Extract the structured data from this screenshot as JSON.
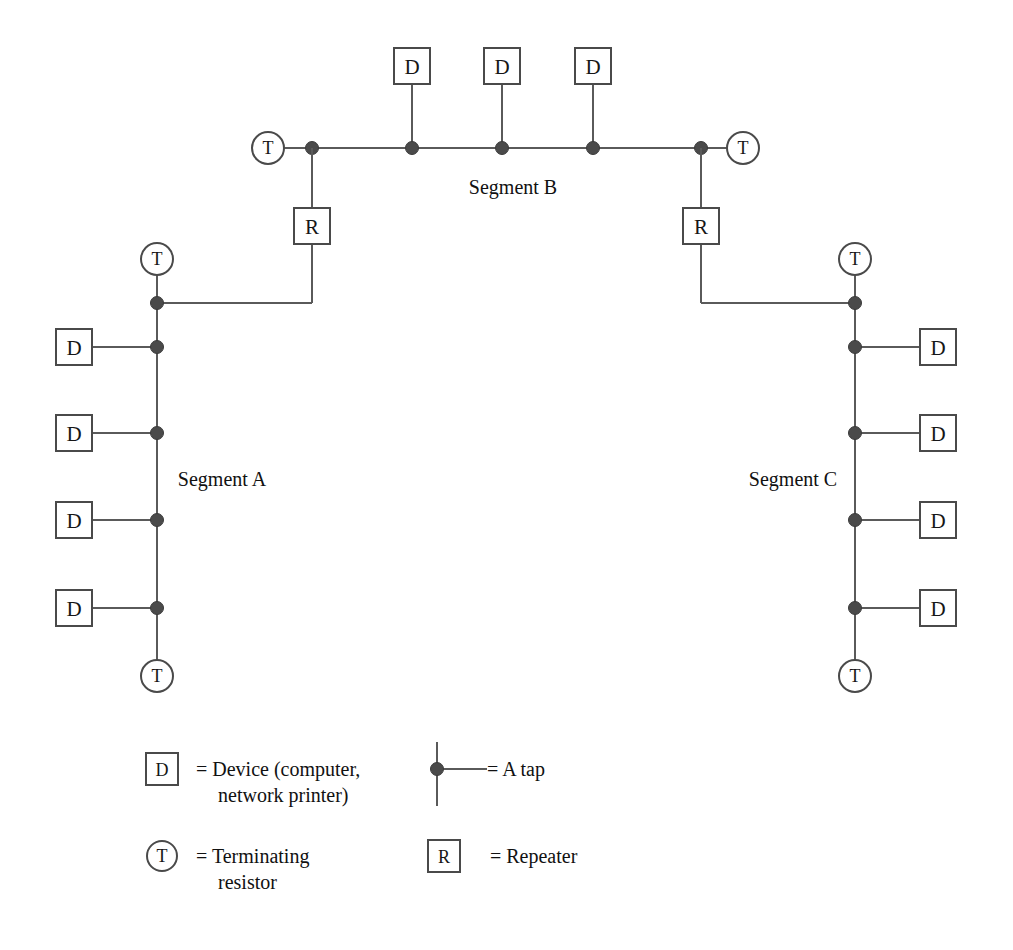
{
  "diagram": {
    "type": "network-topology",
    "background_color": "#ffffff",
    "line_color": "#5a5a5a",
    "node_stroke_color": "#4a4a4a",
    "tap_color": "#4a4a4a",
    "text_color": "#111111"
  },
  "glyphs": {
    "device": "D",
    "terminator": "T",
    "repeater": "R"
  },
  "segments": [
    {
      "id": "segment-a",
      "label": "Segment A",
      "orientation": "vertical",
      "device_side": "left",
      "device_count": 4,
      "terminator_count": 2,
      "tap_count": 5
    },
    {
      "id": "segment-b",
      "label": "Segment B",
      "orientation": "horizontal",
      "device_side": "top",
      "device_count": 3,
      "terminator_count": 2,
      "tap_count": 5
    },
    {
      "id": "segment-c",
      "label": "Segment C",
      "orientation": "vertical",
      "device_side": "right",
      "device_count": 4,
      "terminator_count": 2,
      "tap_count": 5
    }
  ],
  "repeaters": [
    {
      "id": "repeater-left",
      "label": "R",
      "connects": [
        "Segment B",
        "Segment A"
      ]
    },
    {
      "id": "repeater-right",
      "label": "R",
      "connects": [
        "Segment B",
        "Segment C"
      ]
    }
  ],
  "legend": {
    "items": [
      {
        "id": "legend-device",
        "symbol": "device-box",
        "symbol_label": "D",
        "equals": "=",
        "text_line1": "= Device (computer,",
        "text_line2": "network printer)"
      },
      {
        "id": "legend-tap",
        "symbol": "tap-mark",
        "symbol_label": "",
        "equals": "=",
        "text_line1": "= A tap",
        "text_line2": ""
      },
      {
        "id": "legend-terminator",
        "symbol": "terminator-circle",
        "symbol_label": "T",
        "equals": "=",
        "text_line1": "= Terminating",
        "text_line2": "resistor"
      },
      {
        "id": "legend-repeater",
        "symbol": "repeater-box",
        "symbol_label": "R",
        "equals": "=",
        "text_line1": "= Repeater",
        "text_line2": ""
      }
    ]
  }
}
